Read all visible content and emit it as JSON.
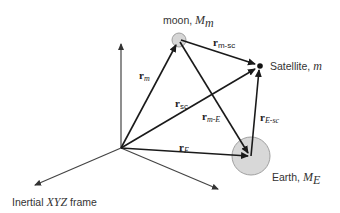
{
  "diagram": {
    "nodes": {
      "origin": {
        "x": 121,
        "y": 148
      },
      "moon": {
        "x": 179,
        "y": 40,
        "r": 7,
        "label_text": "moon, ",
        "label_sym": "M",
        "label_sub": "m"
      },
      "satellite": {
        "x": 260,
        "y": 66,
        "label_text": "Satellite, ",
        "label_sym": "m"
      },
      "earth": {
        "x": 251,
        "y": 156,
        "r": 19,
        "label_text": "Earth, ",
        "label_sym": "M",
        "label_sub": "E"
      }
    },
    "frame_label": {
      "text": "Inertial ",
      "sym": "XYZ",
      "tail": " frame"
    },
    "vectors": [
      {
        "id": "r_m",
        "bold": "r",
        "sub": "m",
        "from": "origin",
        "to": "moon"
      },
      {
        "id": "r_sc",
        "bold": "r",
        "sub": "sc",
        "from": "origin",
        "to": "satellite"
      },
      {
        "id": "r_E",
        "bold": "r",
        "sub": "E",
        "from": "origin",
        "to": "earth"
      },
      {
        "id": "r_m-sc",
        "bold": "r",
        "sub": "m-sc",
        "from": "moon",
        "to": "satellite"
      },
      {
        "id": "r_m-E",
        "bold": "r",
        "sub": "m-E",
        "from": "moon",
        "to": "earth"
      },
      {
        "id": "r_E-sc",
        "bold": "r",
        "sub": "E-sc",
        "from": "earth",
        "to": "satellite"
      }
    ],
    "colors": {
      "line": "#1a1a1a",
      "axis": "#444444",
      "body_fill": "#d8d8d8",
      "body_stroke": "#a0a0a0"
    }
  }
}
